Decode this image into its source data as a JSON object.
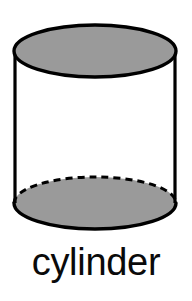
{
  "figure": {
    "caption": "cylinder",
    "shape_name": "cylinder",
    "background_color": "#ffffff",
    "outline_color": "#000000",
    "fill_color": "#9a9a9a",
    "body_fill_color": "#ffffff",
    "caption_color": "#0a0a0a",
    "stroke_width": 3,
    "geometry": {
      "center_x": 95,
      "radius_x": 81,
      "radius_y": 26,
      "top_ellipse_center_y": 51,
      "bottom_ellipse_center_y": 203,
      "body_height": 152,
      "left_edge_x": 14,
      "right_edge_x": 176
    },
    "parts": [
      {
        "name": "top-face",
        "label": "top circular face",
        "style": "solid",
        "fill": "#9a9a9a"
      },
      {
        "name": "lateral-surface",
        "label": "curved lateral surface",
        "style": "solid",
        "fill": "#ffffff"
      },
      {
        "name": "bottom-face",
        "label": "bottom circular face",
        "style": "solid",
        "fill": "#9a9a9a"
      },
      {
        "name": "hidden-edge",
        "label": "hidden back edge of bottom face",
        "style": "dashed",
        "fill": "none"
      }
    ]
  }
}
